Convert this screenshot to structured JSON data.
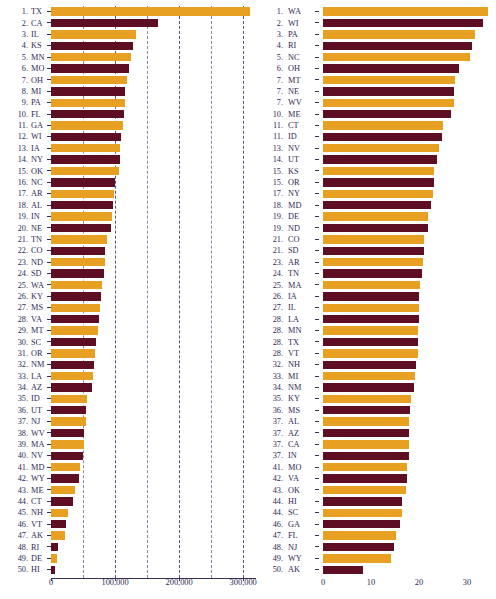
{
  "chart_data": [
    {
      "id": "left",
      "type": "bar",
      "orientation": "horizontal",
      "title": "",
      "xlabel": "",
      "ylabel": "",
      "xlim": [
        0,
        320000
      ],
      "xticks": [
        0,
        100000,
        200000,
        300000
      ],
      "xtick_labels": [
        "0",
        "100,000",
        "200,000",
        "300,000"
      ],
      "minor_gridlines": [
        50000,
        150000,
        250000
      ],
      "grid": true,
      "bar_colors": [
        "#e8a022",
        "#5e0e22"
      ],
      "categories": [
        "TX",
        "CA",
        "IL",
        "KS",
        "MN",
        "MO",
        "OH",
        "MI",
        "PA",
        "FL",
        "GA",
        "WI",
        "IA",
        "NY",
        "OK",
        "NC",
        "AR",
        "AL",
        "IN",
        "NE",
        "TN",
        "CO",
        "ND",
        "SD",
        "WA",
        "KY",
        "MS",
        "VA",
        "MT",
        "SC",
        "OR",
        "NM",
        "LA",
        "AZ",
        "ID",
        "UT",
        "NJ",
        "WV",
        "MA",
        "NV",
        "MD",
        "WY",
        "ME",
        "CT",
        "NH",
        "VT",
        "AK",
        "RI",
        "DE",
        "HI"
      ],
      "ranks": [
        "1.",
        "2.",
        "3.",
        "4.",
        "5.",
        "6.",
        "7.",
        "8.",
        "9.",
        "10.",
        "11.",
        "12.",
        "13.",
        "14.",
        "15.",
        "16.",
        "17.",
        "18.",
        "19.",
        "20.",
        "21.",
        "22.",
        "23.",
        "24.",
        "25.",
        "26.",
        "27.",
        "28.",
        "29.",
        "30.",
        "31.",
        "32.",
        "33.",
        "34.",
        "35.",
        "36.",
        "37.",
        "38.",
        "39.",
        "40.",
        "41.",
        "42.",
        "43.",
        "44.",
        "45.",
        "46.",
        "47.",
        "48.",
        "49.",
        "50."
      ],
      "values": [
        310000,
        167000,
        133000,
        128000,
        125000,
        122000,
        118000,
        116000,
        115000,
        114000,
        113000,
        110000,
        108000,
        107000,
        106000,
        100000,
        99000,
        96000,
        95000,
        94000,
        88000,
        85000,
        84000,
        82000,
        80000,
        78000,
        76000,
        75000,
        74000,
        70000,
        69000,
        67000,
        65000,
        64000,
        56000,
        55000,
        54000,
        52000,
        51000,
        50000,
        45000,
        43000,
        38000,
        34000,
        26000,
        23000,
        22000,
        11000,
        9000,
        6000
      ]
    },
    {
      "id": "right",
      "type": "bar",
      "orientation": "horizontal",
      "title": "",
      "xlabel": "",
      "ylabel": "",
      "xlim": [
        0,
        35
      ],
      "xticks": [
        0,
        10,
        20,
        30
      ],
      "xtick_labels": [
        "0",
        "10",
        "20",
        "30"
      ],
      "minor_gridlines": [],
      "grid": true,
      "bar_colors": [
        "#e8a022",
        "#5e0e22"
      ],
      "categories": [
        "WA",
        "WI",
        "PA",
        "RI",
        "NC",
        "OH",
        "MT",
        "NE",
        "WV",
        "ME",
        "CT",
        "ID",
        "NV",
        "UT",
        "KS",
        "OR",
        "NY",
        "MD",
        "DE",
        "ND",
        "CO",
        "SD",
        "AR",
        "TN",
        "MA",
        "IA",
        "IL",
        "LA",
        "MN",
        "TX",
        "VT",
        "NH",
        "MI",
        "NM",
        "KY",
        "MS",
        "AL",
        "AZ",
        "CA",
        "IN",
        "MO",
        "VA",
        "OK",
        "HI",
        "SC",
        "GA",
        "FL",
        "NJ",
        "WY",
        "AK"
      ],
      "ranks": [
        "1.",
        "2.",
        "3.",
        "4.",
        "5.",
        "6.",
        "7.",
        "7.",
        "7.",
        "10.",
        "11.",
        "11.",
        "13.",
        "14.",
        "15.",
        "15.",
        "17.",
        "18.",
        "19.",
        "19.",
        "21.",
        "21.",
        "23.",
        "24.",
        "25.",
        "26.",
        "27.",
        "28.",
        "28.",
        "28.",
        "28.",
        "32.",
        "33.",
        "34.",
        "35.",
        "36.",
        "37.",
        "37.",
        "37.",
        "37.",
        "41.",
        "42.",
        "43.",
        "44.",
        "44.",
        "46.",
        "47.",
        "48.",
        "49.",
        "50."
      ],
      "values": [
        34.4,
        33.3,
        31.6,
        31.1,
        30.6,
        28.3,
        27.4,
        27.3,
        27.3,
        26.6,
        25.1,
        24.8,
        24.2,
        23.8,
        23.2,
        23.2,
        23.0,
        22.5,
        21.9,
        21.8,
        21.1,
        21.0,
        20.8,
        20.6,
        20.2,
        20.0,
        19.9,
        19.9,
        19.8,
        19.8,
        19.8,
        19.3,
        19.1,
        18.9,
        18.4,
        18.1,
        17.9,
        17.9,
        17.9,
        17.9,
        17.6,
        17.5,
        17.2,
        16.5,
        16.5,
        16.0,
        15.3,
        14.8,
        14.2,
        8.4
      ]
    }
  ]
}
